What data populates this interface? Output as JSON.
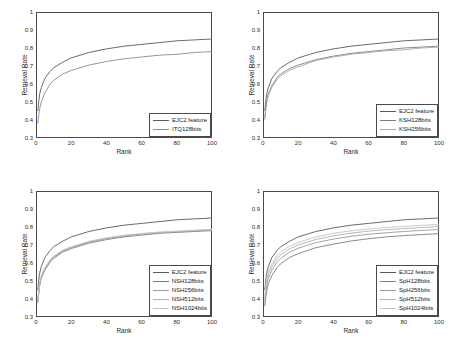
{
  "figure": {
    "panels": [
      {
        "id": "panel-itq",
        "ylabel": "Retrieval Rate",
        "xlabel": "Rank",
        "yticks": [
          "0.3",
          "0.4",
          "0.5",
          "0.6",
          "0.7",
          "0.8",
          "0.9",
          "1"
        ],
        "xticks": [
          "0",
          "20",
          "40",
          "60",
          "80",
          "100"
        ],
        "legend": [
          {
            "label": "EJC2 feature",
            "color": "#5a5a5a"
          },
          {
            "label": "ITQ128bits",
            "color": "#8c8c8c"
          }
        ]
      },
      {
        "id": "panel-ksh",
        "ylabel": "Retrieval Rate",
        "xlabel": "Rank",
        "yticks": [
          "0.3",
          "0.4",
          "0.5",
          "0.6",
          "0.7",
          "0.8",
          "0.9",
          "1"
        ],
        "xticks": [
          "0",
          "20",
          "40",
          "60",
          "80",
          "100"
        ],
        "legend": [
          {
            "label": "EJC2 feature",
            "color": "#5a5a5a"
          },
          {
            "label": "KSH128bits",
            "color": "#7d7d7d"
          },
          {
            "label": "KSH256bits",
            "color": "#a8a8a8"
          }
        ]
      },
      {
        "id": "panel-nsh",
        "ylabel": "Retrieval Rate",
        "xlabel": "Rank",
        "yticks": [
          "0.3",
          "0.4",
          "0.5",
          "0.6",
          "0.7",
          "0.8",
          "0.9",
          "1"
        ],
        "xticks": [
          "0",
          "20",
          "40",
          "60",
          "80",
          "100"
        ],
        "legend": [
          {
            "label": "EJC2 feature",
            "color": "#5a5a5a"
          },
          {
            "label": "NSH128bits",
            "color": "#7d7d7d"
          },
          {
            "label": "NSH256bits",
            "color": "#9a9a9a"
          },
          {
            "label": "NSH512bits",
            "color": "#b0b0b0"
          },
          {
            "label": "NSH1024bits",
            "color": "#c4c4c4"
          }
        ]
      },
      {
        "id": "panel-sph",
        "ylabel": "Retrieval Rate",
        "xlabel": "Rank",
        "yticks": [
          "0.3",
          "0.4",
          "0.5",
          "0.6",
          "0.7",
          "0.8",
          "0.9",
          "1"
        ],
        "xticks": [
          "0",
          "20",
          "40",
          "60",
          "80",
          "100"
        ],
        "legend": [
          {
            "label": "EJC2 feature",
            "color": "#5a5a5a"
          },
          {
            "label": "SpH128bits",
            "color": "#7d7d7d"
          },
          {
            "label": "SpH256bits",
            "color": "#9a9a9a"
          },
          {
            "label": "SpH512bits",
            "color": "#b0b0b0"
          },
          {
            "label": "SpH1024bits",
            "color": "#c4c4c4"
          }
        ]
      }
    ]
  },
  "chart_data": [
    {
      "type": "line",
      "title": "",
      "xlabel": "Rank",
      "ylabel": "Retrieval Rate",
      "xlim": [
        0,
        100
      ],
      "ylim": [
        0.3,
        1.0
      ],
      "xticks": [
        0,
        20,
        40,
        60,
        80,
        100
      ],
      "yticks": [
        0.3,
        0.4,
        0.5,
        0.6,
        0.7,
        0.8,
        0.9,
        1.0
      ],
      "grid": false,
      "legend_position": "bottom-right",
      "x": [
        1,
        2,
        3,
        5,
        8,
        10,
        15,
        20,
        30,
        40,
        50,
        60,
        70,
        80,
        90,
        100
      ],
      "series": [
        {
          "name": "EJC2 feature",
          "values": [
            0.45,
            0.54,
            0.58,
            0.63,
            0.67,
            0.69,
            0.72,
            0.745,
            0.775,
            0.795,
            0.81,
            0.82,
            0.83,
            0.84,
            0.845,
            0.85
          ]
        },
        {
          "name": "ITQ128bits",
          "values": [
            0.38,
            0.46,
            0.5,
            0.55,
            0.6,
            0.62,
            0.655,
            0.675,
            0.705,
            0.725,
            0.74,
            0.75,
            0.76,
            0.765,
            0.775,
            0.78
          ]
        }
      ]
    },
    {
      "type": "line",
      "title": "",
      "xlabel": "Rank",
      "ylabel": "Retrieval Rate",
      "xlim": [
        0,
        100
      ],
      "ylim": [
        0.3,
        1.0
      ],
      "xticks": [
        0,
        20,
        40,
        60,
        80,
        100
      ],
      "yticks": [
        0.3,
        0.4,
        0.5,
        0.6,
        0.7,
        0.8,
        0.9,
        1.0
      ],
      "grid": false,
      "legend_position": "bottom-right",
      "x": [
        1,
        2,
        3,
        5,
        8,
        10,
        15,
        20,
        30,
        40,
        50,
        60,
        70,
        80,
        90,
        100
      ],
      "series": [
        {
          "name": "EJC2 feature",
          "values": [
            0.45,
            0.54,
            0.58,
            0.63,
            0.67,
            0.69,
            0.72,
            0.745,
            0.775,
            0.795,
            0.81,
            0.82,
            0.83,
            0.84,
            0.845,
            0.85
          ]
        },
        {
          "name": "KSH128bits",
          "values": [
            0.41,
            0.5,
            0.545,
            0.59,
            0.635,
            0.655,
            0.685,
            0.705,
            0.735,
            0.755,
            0.77,
            0.78,
            0.79,
            0.8,
            0.805,
            0.81
          ]
        },
        {
          "name": "KSH256bits",
          "values": [
            0.4,
            0.49,
            0.535,
            0.58,
            0.625,
            0.645,
            0.675,
            0.695,
            0.73,
            0.75,
            0.765,
            0.775,
            0.785,
            0.79,
            0.8,
            0.805
          ]
        }
      ]
    },
    {
      "type": "line",
      "title": "",
      "xlabel": "Rank",
      "ylabel": "Retrieval Rate",
      "xlim": [
        0,
        100
      ],
      "ylim": [
        0.3,
        1.0
      ],
      "xticks": [
        0,
        20,
        40,
        60,
        80,
        100
      ],
      "yticks": [
        0.3,
        0.4,
        0.5,
        0.6,
        0.7,
        0.8,
        0.9,
        1.0
      ],
      "grid": false,
      "legend_position": "bottom-right",
      "x": [
        1,
        2,
        3,
        5,
        8,
        10,
        15,
        20,
        30,
        40,
        50,
        60,
        70,
        80,
        90,
        100
      ],
      "series": [
        {
          "name": "EJC2 feature",
          "values": [
            0.45,
            0.54,
            0.58,
            0.63,
            0.67,
            0.69,
            0.72,
            0.745,
            0.775,
            0.795,
            0.81,
            0.82,
            0.83,
            0.84,
            0.845,
            0.85
          ]
        },
        {
          "name": "NSH128bits",
          "values": [
            0.38,
            0.47,
            0.515,
            0.56,
            0.605,
            0.625,
            0.66,
            0.68,
            0.71,
            0.73,
            0.745,
            0.755,
            0.765,
            0.77,
            0.775,
            0.78
          ]
        },
        {
          "name": "NSH256bits",
          "values": [
            0.385,
            0.475,
            0.52,
            0.565,
            0.61,
            0.63,
            0.665,
            0.685,
            0.715,
            0.735,
            0.75,
            0.76,
            0.768,
            0.773,
            0.778,
            0.783
          ]
        },
        {
          "name": "NSH512bits",
          "values": [
            0.39,
            0.48,
            0.525,
            0.57,
            0.615,
            0.635,
            0.668,
            0.688,
            0.718,
            0.738,
            0.752,
            0.762,
            0.77,
            0.775,
            0.78,
            0.785
          ]
        },
        {
          "name": "NSH1024bits",
          "values": [
            0.395,
            0.485,
            0.53,
            0.575,
            0.618,
            0.638,
            0.67,
            0.69,
            0.72,
            0.74,
            0.754,
            0.764,
            0.772,
            0.777,
            0.782,
            0.787
          ]
        }
      ]
    },
    {
      "type": "line",
      "title": "",
      "xlabel": "Rank",
      "ylabel": "Retrieval Rate",
      "xlim": [
        0,
        100
      ],
      "ylim": [
        0.3,
        1.0
      ],
      "xticks": [
        0,
        20,
        40,
        60,
        80,
        100
      ],
      "yticks": [
        0.3,
        0.4,
        0.5,
        0.6,
        0.7,
        0.8,
        0.9,
        1.0
      ],
      "grid": false,
      "legend_position": "bottom-right",
      "x": [
        1,
        2,
        3,
        5,
        8,
        10,
        15,
        20,
        30,
        40,
        50,
        60,
        70,
        80,
        90,
        100
      ],
      "series": [
        {
          "name": "EJC2 feature",
          "values": [
            0.45,
            0.54,
            0.58,
            0.63,
            0.67,
            0.69,
            0.72,
            0.745,
            0.775,
            0.795,
            0.81,
            0.82,
            0.83,
            0.84,
            0.845,
            0.85
          ]
        },
        {
          "name": "SpH128bits",
          "values": [
            0.36,
            0.44,
            0.485,
            0.53,
            0.575,
            0.595,
            0.63,
            0.652,
            0.685,
            0.705,
            0.722,
            0.735,
            0.745,
            0.752,
            0.758,
            0.763
          ]
        },
        {
          "name": "SpH256bits",
          "values": [
            0.38,
            0.47,
            0.515,
            0.56,
            0.605,
            0.625,
            0.66,
            0.682,
            0.713,
            0.733,
            0.748,
            0.76,
            0.768,
            0.775,
            0.781,
            0.786
          ]
        },
        {
          "name": "SpH512bits",
          "values": [
            0.4,
            0.49,
            0.535,
            0.58,
            0.625,
            0.645,
            0.678,
            0.7,
            0.731,
            0.751,
            0.766,
            0.777,
            0.785,
            0.791,
            0.797,
            0.802
          ]
        },
        {
          "name": "SpH1024bits",
          "values": [
            0.415,
            0.505,
            0.55,
            0.595,
            0.64,
            0.66,
            0.693,
            0.714,
            0.745,
            0.765,
            0.779,
            0.789,
            0.797,
            0.803,
            0.809,
            0.814
          ]
        }
      ]
    }
  ]
}
